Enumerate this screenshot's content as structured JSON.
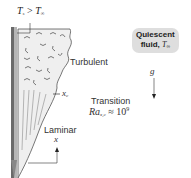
{
  "diagram": {
    "title_condition": {
      "T": "T",
      "s_sub": "s",
      "op": " > ",
      "T2": "T",
      "inf_sub": "∞"
    },
    "regions": {
      "turbulent": "Turbulent",
      "laminar": "Laminar"
    },
    "transition": {
      "label": "Transition",
      "criterion_base": "Ra",
      "criterion_sub": "x,c",
      "criterion_rest": " ≈ 10",
      "criterion_exp": "9"
    },
    "critical_position": {
      "symbol": "x",
      "sub": "c"
    },
    "fluid_callout": {
      "line1": "Quiescent",
      "line2": "fluid, ",
      "T": "T",
      "inf_sub": "∞"
    },
    "gravity": {
      "symbol": "g"
    },
    "axis": {
      "symbol": "x"
    },
    "colors": {
      "plate_dark": "#6a6a6a",
      "plate_light": "#b5b5b5",
      "boundary_layer_fill": "#ededed",
      "callout_bg": "#dedede",
      "line": "#333333"
    }
  }
}
